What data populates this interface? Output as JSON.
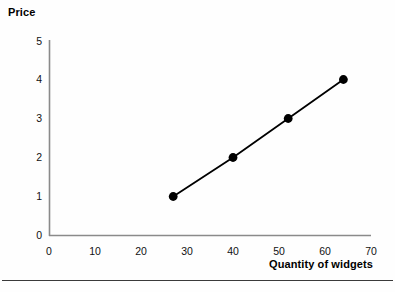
{
  "chart_data": {
    "type": "line",
    "title": "",
    "xlabel": "Quantity of widgets",
    "ylabel": "Price",
    "xlim": [
      0,
      70
    ],
    "ylim": [
      0,
      5
    ],
    "xticks": [
      0,
      10,
      20,
      30,
      40,
      50,
      60,
      70
    ],
    "yticks": [
      0,
      1,
      2,
      3,
      4,
      5
    ],
    "grid": false,
    "legend": false,
    "marker": "filled-circle",
    "line_color": "#000000",
    "marker_color": "#000000",
    "axis_color": "#8a8a8a",
    "series": [
      {
        "name": "supply",
        "x": [
          27,
          40,
          52,
          64
        ],
        "y": [
          1,
          2,
          3,
          4
        ]
      }
    ],
    "points": [
      {
        "x": 27,
        "y": 1
      },
      {
        "x": 40,
        "y": 2
      },
      {
        "x": 52,
        "y": 3
      },
      {
        "x": 64,
        "y": 4
      }
    ]
  },
  "axes": {
    "y_title": "Price",
    "x_title": "Quantity of widgets",
    "y_tick_labels": [
      "5",
      "4",
      "3",
      "2",
      "1",
      "0"
    ],
    "x_tick_labels": [
      "0",
      "10",
      "20",
      "30",
      "40",
      "50",
      "60",
      "70"
    ]
  }
}
